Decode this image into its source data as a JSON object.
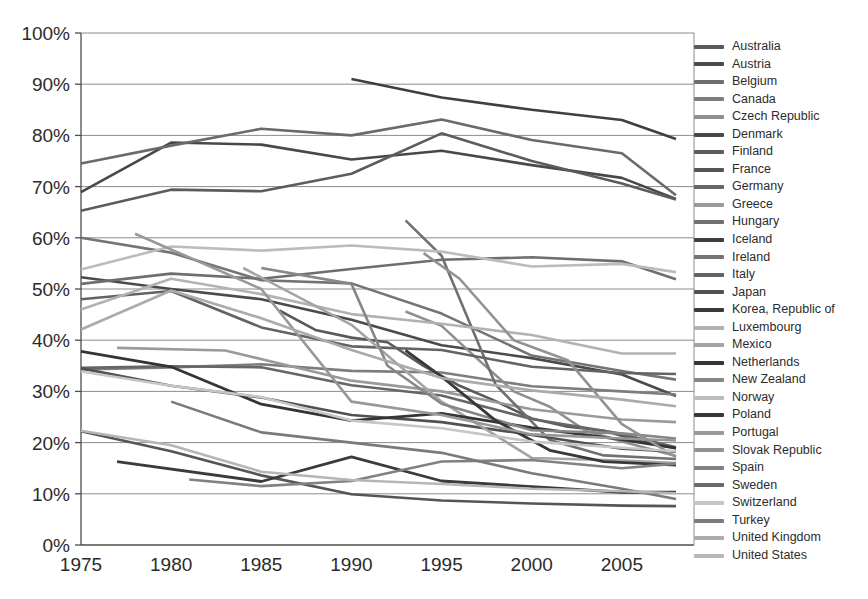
{
  "chart_data": {
    "type": "line",
    "title": "",
    "subtitle": "",
    "xlabel": "",
    "ylabel": "",
    "xlim": [
      1975,
      2009
    ],
    "ylim": [
      0,
      1.0
    ],
    "grid": true,
    "legend_position": "right",
    "y_ticks": [
      "0%",
      "10%",
      "20%",
      "30%",
      "40%",
      "50%",
      "60%",
      "70%",
      "80%",
      "90%",
      "100%"
    ],
    "y_tick_values": [
      0,
      10,
      20,
      30,
      40,
      50,
      60,
      70,
      80,
      90,
      100
    ],
    "x_ticks": [
      "1975",
      "1980",
      "1985",
      "1990",
      "1995",
      "2000",
      "2005"
    ],
    "x_tick_values": [
      1975,
      1980,
      1985,
      1990,
      1995,
      2000,
      2005
    ],
    "series": [
      {
        "name": "Australia",
        "color": "#595959",
        "width": 2.6,
        "x": [
          1986,
          1988,
          1990,
          1992,
          1994,
          1996,
          1998,
          2000,
          2002,
          2004,
          2006,
          2008
        ],
        "values": [
          45.8,
          42.0,
          40.5,
          39.6,
          35.0,
          31.1,
          28.1,
          24.7,
          23.1,
          22.3,
          20.3,
          18.9
        ]
      },
      {
        "name": "Austria",
        "color": "#4a4a4a",
        "width": 2.6,
        "x": [
          1975,
          1980,
          1985,
          1990,
          1995,
          2000,
          2005,
          2008
        ],
        "values": [
          52.3,
          50.0,
          48.0,
          44.0,
          39.0,
          36.5,
          33.3,
          29.1
        ]
      },
      {
        "name": "Belgium",
        "color": "#6e6e6e",
        "width": 2.6,
        "x": [
          1975,
          1980,
          1985,
          1990,
          1995,
          2000,
          2005,
          2008
        ],
        "values": [
          51.0,
          53.0,
          52.0,
          53.9,
          55.7,
          56.2,
          55.4,
          51.9
        ]
      },
      {
        "name": "Canada",
        "color": "#7d7d7d",
        "width": 2.6,
        "x": [
          1975,
          1980,
          1985,
          1990,
          1995,
          2000,
          2005,
          2008
        ],
        "values": [
          34.3,
          34.7,
          35.3,
          34.0,
          33.7,
          31.0,
          30.0,
          29.4
        ]
      },
      {
        "name": "Czech Republic",
        "color": "#8f8f8f",
        "width": 2.6,
        "x": [
          1993,
          1995,
          1997,
          1999,
          2001,
          2003,
          2005,
          2008
        ],
        "values": [
          45.6,
          42.8,
          36.3,
          30.0,
          27.0,
          22.3,
          20.2,
          17.4
        ]
      },
      {
        "name": "Denmark",
        "color": "#484848",
        "width": 2.6,
        "x": [
          1975,
          1980,
          1985,
          1990,
          1995,
          2000,
          2005,
          2008
        ],
        "values": [
          68.9,
          78.6,
          78.2,
          75.3,
          77.0,
          74.2,
          71.7,
          67.6
        ]
      },
      {
        "name": "Finland",
        "color": "#5c5c5c",
        "width": 2.6,
        "x": [
          1975,
          1980,
          1985,
          1990,
          1995,
          2000,
          2005,
          2008
        ],
        "values": [
          65.3,
          69.4,
          69.1,
          72.5,
          80.4,
          75.0,
          70.6,
          67.5
        ]
      },
      {
        "name": "France",
        "color": "#555555",
        "width": 2.6,
        "x": [
          1975,
          1980,
          1985,
          1990,
          1995,
          2000,
          2005,
          2008
        ],
        "values": [
          22.2,
          18.3,
          13.6,
          9.9,
          8.7,
          8.1,
          7.7,
          7.6
        ]
      },
      {
        "name": "Germany",
        "color": "#666666",
        "width": 2.6,
        "x": [
          1975,
          1980,
          1985,
          1990,
          1995,
          2000,
          2005,
          2008
        ],
        "values": [
          34.6,
          34.9,
          34.7,
          31.2,
          29.2,
          24.6,
          21.7,
          19.1
        ]
      },
      {
        "name": "Greece",
        "color": "#9a9a9a",
        "width": 2.6,
        "x": [
          1977,
          1983,
          1990,
          1995,
          2000,
          2005,
          2008
        ],
        "values": [
          38.5,
          38.0,
          32.1,
          30.0,
          26.5,
          24.5,
          24.0
        ]
      },
      {
        "name": "Hungary",
        "color": "#707070",
        "width": 2.6,
        "x": [
          1993,
          1995,
          1998,
          2001,
          2004,
          2008
        ],
        "values": [
          63.4,
          56.5,
          31.3,
          20.5,
          17.5,
          16.8
        ]
      },
      {
        "name": "Iceland",
        "color": "#3f3f3f",
        "width": 2.6,
        "x": [
          1990,
          1995,
          2000,
          2005,
          2008
        ],
        "values": [
          91.0,
          87.4,
          85.0,
          83.0,
          79.3
        ]
      },
      {
        "name": "Ireland",
        "color": "#747474",
        "width": 2.6,
        "x": [
          1975,
          1980,
          1985,
          1990,
          1995,
          2000,
          2005,
          2008
        ],
        "values": [
          60.0,
          57.1,
          51.7,
          51.1,
          45.2,
          37.0,
          34.0,
          32.3
        ]
      },
      {
        "name": "Italy",
        "color": "#636363",
        "width": 2.6,
        "x": [
          1975,
          1980,
          1985,
          1990,
          1995,
          2000,
          2005,
          2008
        ],
        "values": [
          48.0,
          49.6,
          42.5,
          38.8,
          38.1,
          34.8,
          33.6,
          33.4
        ]
      },
      {
        "name": "Japan",
        "color": "#515151",
        "width": 2.6,
        "x": [
          1975,
          1980,
          1985,
          1990,
          1995,
          2000,
          2005,
          2008
        ],
        "values": [
          34.5,
          31.1,
          28.8,
          25.4,
          24.0,
          21.5,
          18.8,
          18.2
        ]
      },
      {
        "name": "Korea, Republic of",
        "color": "#3a3a3a",
        "width": 2.8,
        "x": [
          1977,
          1985,
          1990,
          1995,
          2000,
          2005,
          2008
        ],
        "values": [
          16.3,
          12.4,
          17.2,
          12.5,
          11.4,
          10.3,
          10.3
        ]
      },
      {
        "name": "Luxembourg",
        "color": "#b2b2b2",
        "width": 2.6,
        "x": [
          1975,
          1980,
          1985,
          1990,
          1995,
          2000,
          2005,
          2008
        ],
        "values": [
          46.0,
          52.0,
          49.0,
          45.1,
          43.2,
          41.0,
          37.4,
          37.4
        ]
      },
      {
        "name": "Mexico",
        "color": "#a4a4a4",
        "width": 2.6,
        "x": [
          1984,
          1990,
          1995,
          2000,
          2005,
          2008
        ],
        "values": [
          54.1,
          43.0,
          28.0,
          17.0,
          16.5,
          16.0
        ]
      },
      {
        "name": "Netherlands",
        "color": "#343434",
        "width": 2.8,
        "x": [
          1975,
          1980,
          1985,
          1990,
          1995,
          2000,
          2005,
          2008
        ],
        "values": [
          37.8,
          34.8,
          27.5,
          24.3,
          25.7,
          22.9,
          20.6,
          18.9
        ]
      },
      {
        "name": "New Zealand",
        "color": "#878787",
        "width": 2.6,
        "x": [
          1985,
          1990,
          1992,
          1995,
          2000,
          2005,
          2008
        ],
        "values": [
          54.1,
          51.0,
          35.0,
          27.6,
          22.4,
          21.8,
          20.8
        ]
      },
      {
        "name": "Norway",
        "color": "#bcbcbc",
        "width": 2.6,
        "x": [
          1975,
          1980,
          1985,
          1990,
          1995,
          2000,
          2005,
          2008
        ],
        "values": [
          53.8,
          58.3,
          57.5,
          58.5,
          57.3,
          54.4,
          54.9,
          53.3
        ]
      },
      {
        "name": "Poland",
        "color": "#383838",
        "width": 2.8,
        "x": [
          1993,
          1995,
          1998,
          2001,
          2004,
          2008
        ],
        "values": [
          38.0,
          32.9,
          24.3,
          18.5,
          16.3,
          15.6
        ]
      },
      {
        "name": "Portugal",
        "color": "#989898",
        "width": 2.6,
        "x": [
          1978,
          1985,
          1990,
          1995,
          2000,
          2005,
          2008
        ],
        "values": [
          60.8,
          50.0,
          28.0,
          25.4,
          21.6,
          20.8,
          20.4
        ]
      },
      {
        "name": "Slovak Republic",
        "color": "#929292",
        "width": 2.6,
        "x": [
          1994,
          1996,
          1999,
          2002,
          2005,
          2008
        ],
        "values": [
          57.0,
          52.0,
          40.0,
          36.1,
          23.6,
          17.2
        ]
      },
      {
        "name": "Spain",
        "color": "#818181",
        "width": 2.6,
        "x": [
          1981,
          1985,
          1990,
          1995,
          2000,
          2005,
          2008
        ],
        "values": [
          12.8,
          11.5,
          12.5,
          16.3,
          16.6,
          15.0,
          15.9
        ]
      },
      {
        "name": "Sweden",
        "color": "#6a6a6a",
        "width": 2.6,
        "x": [
          1975,
          1980,
          1985,
          1990,
          1995,
          2000,
          2005,
          2008
        ],
        "values": [
          74.5,
          78.0,
          81.3,
          80.0,
          83.1,
          79.1,
          76.5,
          68.3
        ]
      },
      {
        "name": "Switzerland",
        "color": "#c6c6c6",
        "width": 2.6,
        "x": [
          1975,
          1980,
          1985,
          1990,
          1995,
          2000,
          2005,
          2008
        ],
        "values": [
          33.9,
          31.1,
          28.9,
          24.3,
          22.8,
          20.2,
          19.0,
          18.3
        ]
      },
      {
        "name": "Turkey",
        "color": "#7a7a7a",
        "width": 2.6,
        "x": [
          1980,
          1985,
          1990,
          1995,
          2000,
          2005,
          2008
        ],
        "values": [
          28.0,
          22.0,
          20.0,
          18.0,
          14.0,
          11.0,
          9.0
        ]
      },
      {
        "name": "United Kingdom",
        "color": "#ababab",
        "width": 2.6,
        "x": [
          1975,
          1980,
          1985,
          1990,
          1995,
          2000,
          2005,
          2008
        ],
        "values": [
          42.1,
          49.7,
          44.3,
          38.1,
          32.6,
          30.2,
          28.4,
          27.1
        ]
      },
      {
        "name": "United States",
        "color": "#b6b6b6",
        "width": 2.6,
        "x": [
          1975,
          1980,
          1985,
          1990,
          1995,
          2000,
          2005,
          2008
        ],
        "values": [
          22.3,
          19.5,
          14.3,
          12.7,
          11.9,
          11.0,
          10.5,
          10.1
        ]
      }
    ]
  },
  "legend": {
    "items": [
      {
        "label": "Australia",
        "color": "#595959"
      },
      {
        "label": "Austria",
        "color": "#4a4a4a"
      },
      {
        "label": "Belgium",
        "color": "#6e6e6e"
      },
      {
        "label": "Canada",
        "color": "#7d7d7d"
      },
      {
        "label": "Czech Republic",
        "color": "#8f8f8f"
      },
      {
        "label": "Denmark",
        "color": "#484848"
      },
      {
        "label": "Finland",
        "color": "#5c5c5c"
      },
      {
        "label": "France",
        "color": "#555555"
      },
      {
        "label": "Germany",
        "color": "#666666"
      },
      {
        "label": "Greece",
        "color": "#9a9a9a"
      },
      {
        "label": "Hungary",
        "color": "#707070"
      },
      {
        "label": "Iceland",
        "color": "#3f3f3f"
      },
      {
        "label": "Ireland",
        "color": "#747474"
      },
      {
        "label": "Italy",
        "color": "#636363"
      },
      {
        "label": "Japan",
        "color": "#515151"
      },
      {
        "label": "Korea, Republic of",
        "color": "#3a3a3a"
      },
      {
        "label": "Luxembourg",
        "color": "#b2b2b2"
      },
      {
        "label": "Mexico",
        "color": "#a4a4a4"
      },
      {
        "label": "Netherlands",
        "color": "#343434"
      },
      {
        "label": "New Zealand",
        "color": "#878787"
      },
      {
        "label": "Norway",
        "color": "#bcbcbc"
      },
      {
        "label": "Poland",
        "color": "#383838"
      },
      {
        "label": "Portugal",
        "color": "#989898"
      },
      {
        "label": "Slovak Republic",
        "color": "#929292"
      },
      {
        "label": "Spain",
        "color": "#818181"
      },
      {
        "label": "Sweden",
        "color": "#6a6a6a"
      },
      {
        "label": "Switzerland",
        "color": "#c6c6c6"
      },
      {
        "label": "Turkey",
        "color": "#7a7a7a"
      },
      {
        "label": "United Kingdom",
        "color": "#ababab"
      },
      {
        "label": "United States",
        "color": "#b6b6b6"
      }
    ]
  },
  "axes": {
    "gridline_color": "#8c8c8c",
    "axis_color": "#4d4d4d",
    "tick_text_color": "#2b2b2b"
  }
}
